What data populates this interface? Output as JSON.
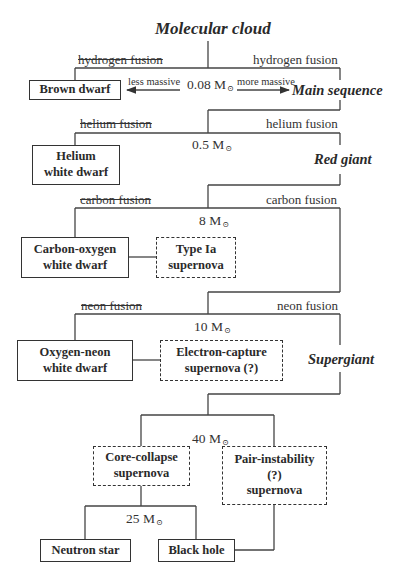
{
  "title": "Molecular cloud",
  "stages": {
    "main_sequence": "Main sequence",
    "red_giant": "Red giant",
    "supergiant": "Supergiant"
  },
  "branches": {
    "hydrogen": {
      "fails": "hydrogen fusion",
      "succeeds": "hydrogen fusion",
      "threshold": "0.08 M",
      "less": "less massive",
      "more": "more massive"
    },
    "helium": {
      "fails": "helium fusion",
      "succeeds": "helium fusion",
      "threshold": "0.5 M"
    },
    "carbon": {
      "fails": "carbon fusion",
      "succeeds": "carbon fusion",
      "threshold": "8 M"
    },
    "neon": {
      "fails": "neon fusion",
      "succeeds": "neon fusion",
      "threshold": "10 M"
    },
    "collapse": {
      "threshold": "40 M"
    },
    "remnant": {
      "threshold": "25 M"
    }
  },
  "solar_symbol": "⊙",
  "outcomes": {
    "brown_dwarf": [
      "Brown dwarf"
    ],
    "helium_wd": [
      "Helium",
      "white dwarf"
    ],
    "co_wd": [
      "Carbon-oxygen",
      "white dwarf"
    ],
    "type_ia": [
      "Type Ia",
      "supernova"
    ],
    "one_wd": [
      "Oxygen-neon",
      "white dwarf"
    ],
    "ec_sn": [
      "Electron-capture",
      "supernova (?)"
    ],
    "cc_sn": [
      "Core-collapse",
      "supernova"
    ],
    "pi_sn": [
      "Pair-instability",
      "(?)",
      "supernova"
    ],
    "neutron_star": [
      "Neutron star"
    ],
    "black_hole": [
      "Black hole"
    ]
  },
  "legend": {
    "solid_box": "stellar remnant",
    "dashed_box": "supernova event"
  }
}
